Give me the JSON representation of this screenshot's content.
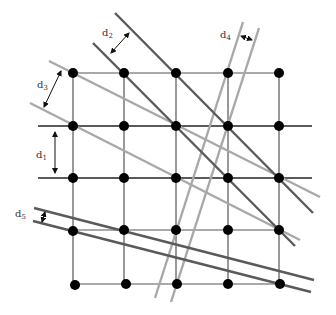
{
  "diagram": {
    "title": "",
    "colors": {
      "background": "#ffffff",
      "grid_line": "#555555",
      "dark_line": "#5a5a5a",
      "light_line": "#a8a8a8",
      "node": "#000000",
      "arrow": "#111111",
      "label": "#333333"
    },
    "grid": {
      "columns_x": [
        73,
        124,
        176,
        228,
        279
      ],
      "rows_y": [
        73,
        126,
        178,
        230,
        284
      ]
    },
    "labels": [
      {
        "id": "d1",
        "base": "d",
        "sub": "1"
      },
      {
        "id": "d2",
        "base": "d",
        "sub": "2"
      },
      {
        "id": "d3",
        "base": "d",
        "sub": "3"
      },
      {
        "id": "d4",
        "base": "d",
        "sub": "4"
      },
      {
        "id": "d5",
        "base": "d",
        "sub": "5"
      }
    ],
    "line_families": [
      {
        "name": "d1",
        "description": "horizontal dark lines through rows 2 and 3",
        "shade": "dark"
      },
      {
        "name": "d2",
        "description": "steep descending dark lines",
        "shade": "dark"
      },
      {
        "name": "d3",
        "description": "descending light gray lines",
        "shade": "light"
      },
      {
        "name": "d4",
        "description": "near-vertical light gray lines",
        "shade": "light"
      },
      {
        "name": "d5",
        "description": "shallow descending dark lines",
        "shade": "dark"
      }
    ]
  }
}
